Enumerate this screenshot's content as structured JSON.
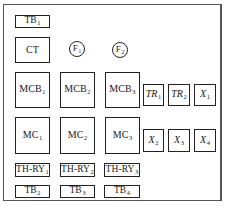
{
  "diagram": {
    "type": "panel-layout",
    "frame": {
      "label": ""
    },
    "components": [
      {
        "id": "tb1",
        "name": "TB",
        "sub": "1",
        "shape": "rect",
        "x": 15,
        "y": 15,
        "w": 35,
        "h": 13
      },
      {
        "id": "ct",
        "name": "CT",
        "sub": "",
        "shape": "rect",
        "x": 15,
        "y": 37,
        "w": 35,
        "h": 26
      },
      {
        "id": "f1",
        "name": "F",
        "sub": "1",
        "shape": "circle",
        "cx": 77,
        "cy": 49
      },
      {
        "id": "f2",
        "name": "F",
        "sub": "2",
        "shape": "circle",
        "cx": 120,
        "cy": 50
      },
      {
        "id": "mcb1",
        "name": "MCB",
        "sub": "1",
        "shape": "rect",
        "x": 15,
        "y": 72,
        "w": 35,
        "h": 36
      },
      {
        "id": "mcb2",
        "name": "MCB",
        "sub": "2",
        "shape": "rect",
        "x": 60,
        "y": 72,
        "w": 35,
        "h": 36
      },
      {
        "id": "mcb3",
        "name": "MCB",
        "sub": "3",
        "shape": "rect",
        "x": 105,
        "y": 72,
        "w": 35,
        "h": 36
      },
      {
        "id": "tr1",
        "name": "TR",
        "sub": "1",
        "shape": "rect",
        "italic": true,
        "x": 143,
        "y": 84,
        "w": 21,
        "h": 22
      },
      {
        "id": "tr2",
        "name": "TR",
        "sub": "2",
        "shape": "rect",
        "italic": true,
        "x": 168,
        "y": 84,
        "w": 22,
        "h": 22
      },
      {
        "id": "x1",
        "name": "X",
        "sub": "1",
        "shape": "rect",
        "italic": true,
        "x": 194,
        "y": 84,
        "w": 22,
        "h": 22
      },
      {
        "id": "mc1",
        "name": "MC",
        "sub": "1",
        "shape": "rect",
        "x": 15,
        "y": 117,
        "w": 35,
        "h": 37
      },
      {
        "id": "mc2",
        "name": "MC",
        "sub": "2",
        "shape": "rect",
        "x": 60,
        "y": 117,
        "w": 35,
        "h": 37
      },
      {
        "id": "mc3",
        "name": "MC",
        "sub": "3",
        "shape": "rect",
        "x": 105,
        "y": 117,
        "w": 35,
        "h": 37
      },
      {
        "id": "x2",
        "name": "X",
        "sub": "2",
        "shape": "rect",
        "italic": true,
        "x": 143,
        "y": 129,
        "w": 21,
        "h": 23
      },
      {
        "id": "x3",
        "name": "X",
        "sub": "3",
        "shape": "rect",
        "italic": true,
        "x": 168,
        "y": 129,
        "w": 22,
        "h": 23
      },
      {
        "id": "x4",
        "name": "X",
        "sub": "4",
        "shape": "rect",
        "italic": true,
        "x": 194,
        "y": 129,
        "w": 22,
        "h": 23
      },
      {
        "id": "thry1",
        "name": "TH-RY",
        "sub": "1",
        "shape": "rect",
        "x": 15,
        "y": 163,
        "w": 35,
        "h": 14
      },
      {
        "id": "thry2",
        "name": "TH-RY",
        "sub": "2",
        "shape": "rect",
        "x": 60,
        "y": 163,
        "w": 35,
        "h": 14
      },
      {
        "id": "thry3",
        "name": "TH-RY",
        "sub": "3",
        "shape": "rect",
        "x": 104,
        "y": 163,
        "w": 36,
        "h": 14
      },
      {
        "id": "tb2",
        "name": "TB",
        "sub": "2",
        "shape": "rect",
        "x": 15,
        "y": 185,
        "w": 35,
        "h": 13
      },
      {
        "id": "tb3",
        "name": "TB",
        "sub": "3",
        "shape": "rect",
        "x": 60,
        "y": 185,
        "w": 35,
        "h": 13
      },
      {
        "id": "tb4",
        "name": "TB",
        "sub": "4",
        "shape": "rect",
        "x": 104,
        "y": 185,
        "w": 36,
        "h": 13
      }
    ]
  },
  "labels": {
    "tb1": {
      "main": "TB",
      "sub": "1"
    },
    "ct": {
      "main": "CT",
      "sub": ""
    },
    "f1": {
      "main": "F",
      "sub": "1"
    },
    "f2": {
      "main": "F",
      "sub": "2"
    },
    "mcb1": {
      "main": "MCB",
      "sub": "1"
    },
    "mcb2": {
      "main": "MCB",
      "sub": "2"
    },
    "mcb3": {
      "main": "MCB",
      "sub": "3"
    },
    "tr1": {
      "main": "TR",
      "sub": "1"
    },
    "tr2": {
      "main": "TR",
      "sub": "2"
    },
    "x1": {
      "main": "X",
      "sub": "1"
    },
    "mc1": {
      "main": "MC",
      "sub": "1"
    },
    "mc2": {
      "main": "MC",
      "sub": "2"
    },
    "mc3": {
      "main": "MC",
      "sub": "3"
    },
    "x2": {
      "main": "X",
      "sub": "2"
    },
    "x3": {
      "main": "X",
      "sub": "3"
    },
    "x4": {
      "main": "X",
      "sub": "4"
    },
    "thry1": {
      "main": "TH-RY",
      "sub": "1"
    },
    "thry2": {
      "main": "TH-RY",
      "sub": "2"
    },
    "thry3": {
      "main": "TH-RY",
      "sub": "3"
    },
    "tb2": {
      "main": "TB",
      "sub": "2"
    },
    "tb3": {
      "main": "TB",
      "sub": "3"
    },
    "tb4": {
      "main": "TB",
      "sub": "4"
    }
  },
  "colors": {
    "stroke": "#222222",
    "frame": "#555555",
    "background": "#ffffff"
  }
}
